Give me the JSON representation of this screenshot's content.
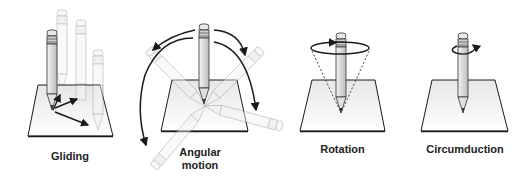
{
  "diagram": {
    "panels": [
      {
        "id": "gliding",
        "label": "Gliding"
      },
      {
        "id": "angular",
        "label_line1": "Angular",
        "label_line2": "motion"
      },
      {
        "id": "rotation",
        "label": "Rotation"
      },
      {
        "id": "circumduction",
        "label": "Circumduction"
      }
    ],
    "colors": {
      "line": "#1a1a1a",
      "pencil_fill": "#e6e6e6",
      "ghost_fill": "#f2f2f2",
      "ghost_stroke": "#b5b5b5",
      "plane_fill": "#f7f7f7"
    }
  }
}
